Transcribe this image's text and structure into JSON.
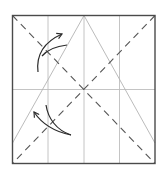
{
  "diagram": {
    "type": "origami-fold-diagram",
    "colors": {
      "background": "#ffffff",
      "border": "#4a4a4a",
      "grid": "#b8b8b8",
      "triangle": "#b0b0b0",
      "valley_fold": "#555555",
      "arrow": "#2a2a2a"
    },
    "square": {
      "x": 12.5,
      "y": 15.5,
      "width": 142.5,
      "height": 148
    },
    "grid_lines": {
      "vertical_x": [
        48,
        84,
        119.5
      ],
      "horizontal_y": [
        89.5
      ]
    },
    "triangle": {
      "apex": [
        84,
        15.5
      ],
      "left_base": [
        12.5,
        143
      ],
      "right_base": [
        155,
        143
      ]
    },
    "valley_folds": [
      {
        "from": [
          12.5,
          15.5
        ],
        "to": [
          155,
          163.5
        ],
        "dash": "7 5"
      },
      {
        "from": [
          155,
          15.5
        ],
        "to": [
          12.5,
          163.5
        ],
        "dash": "7 5"
      }
    ],
    "arrows": [
      {
        "name": "upper-fold-arrow",
        "path": "M38,72 C36,55 44,42 62,34",
        "head": [
          62,
          34
        ],
        "origin_curve": "M42,56 C48,49 58,46 67,45"
      },
      {
        "name": "lower-fold-arrow",
        "path": "M71,135 C56,132 42,124 34,112",
        "head": [
          34,
          112
        ],
        "origin_curve": "M46,105 C48,118 56,130 71,135"
      }
    ]
  }
}
